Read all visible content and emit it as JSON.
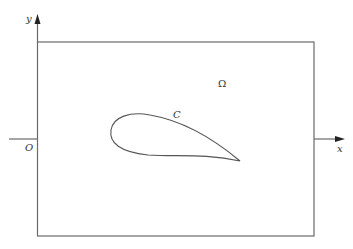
{
  "diagram": {
    "labels": {
      "y_axis": "y",
      "x_axis": "x",
      "origin": "O",
      "curve": "C",
      "domain": "Ω"
    },
    "colors": {
      "stroke": "#555555",
      "arrow": "#222222",
      "text": "#333333"
    },
    "elements": {
      "domain_rectangle": "bounded domain",
      "airfoil_curve": "closed curve C (airfoil profile)"
    }
  }
}
